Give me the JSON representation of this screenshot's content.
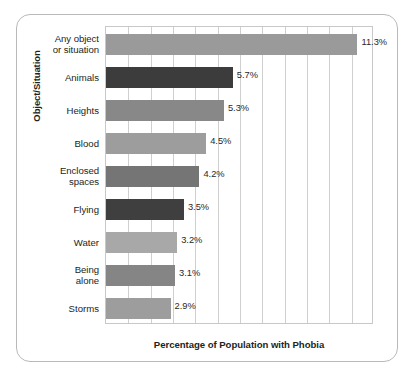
{
  "chart_data": {
    "type": "bar",
    "orientation": "horizontal",
    "title": "",
    "xlabel": "Percentage of Population with Phobia",
    "ylabel": "Object/Situation",
    "xlim": [
      0,
      12
    ],
    "xtick_interval": 1,
    "grid": true,
    "gridlines_vertical": 12,
    "legend": "none",
    "categories": [
      "Any object or situation",
      "Animals",
      "Heights",
      "Blood",
      "Enclosed spaces",
      "Flying",
      "Water",
      "Being alone",
      "Storms"
    ],
    "values": [
      11.3,
      5.7,
      5.3,
      4.5,
      4.2,
      3.5,
      3.2,
      3.1,
      2.9
    ],
    "value_labels": [
      "11.3%",
      "5.7%",
      "5.3%",
      "4.5%",
      "4.2%",
      "3.5%",
      "3.2%",
      "3.1%",
      "2.9%"
    ],
    "bar_colors": [
      "#9a9a9a",
      "#3c3c3c",
      "#888888",
      "#9d9d9d",
      "#757575",
      "#3f3f3f",
      "#a8a8a8",
      "#858585",
      "#9d9d9d"
    ]
  },
  "axis": {
    "y_title": "Object/Situation",
    "x_title": "Percentage of Population with Phobia"
  },
  "category_lines": [
    [
      "Any object",
      "or situation"
    ],
    [
      "Animals"
    ],
    [
      "Heights"
    ],
    [
      "Blood"
    ],
    [
      "Enclosed",
      "spaces"
    ],
    [
      "Flying"
    ],
    [
      "Water"
    ],
    [
      "Being",
      "alone"
    ],
    [
      "Storms"
    ]
  ],
  "style": {
    "frame_border_color": "#b9b9ba",
    "plot_border_color": "#c8c8c9",
    "gridline_color": "#cfcfd0",
    "text_color": "#231f20",
    "background": "#ffffff"
  }
}
